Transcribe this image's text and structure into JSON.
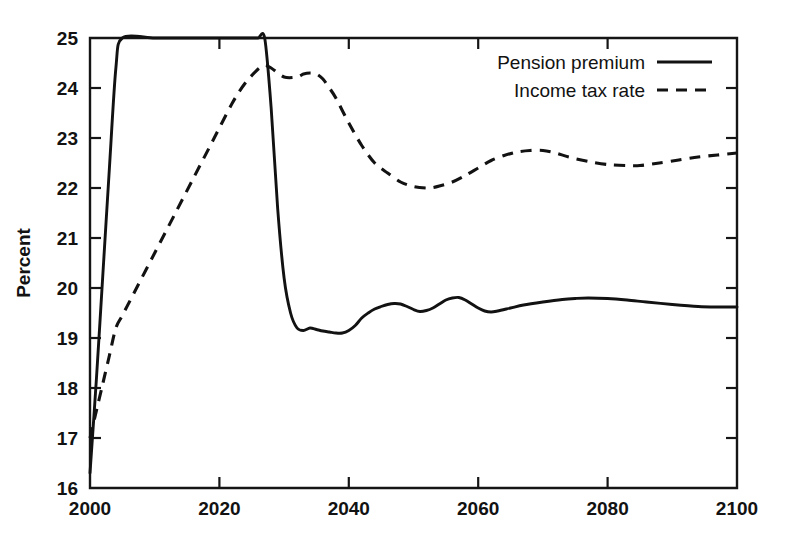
{
  "chart_data": {
    "type": "line",
    "title": "",
    "subtitle": "",
    "xlabel": "",
    "ylabel": "Percent",
    "xlim": [
      2000,
      2100
    ],
    "ylim": [
      16,
      25
    ],
    "xticks": [
      2000,
      2020,
      2040,
      2060,
      2080,
      2100
    ],
    "yticks": [
      16,
      17,
      18,
      19,
      20,
      21,
      22,
      23,
      24,
      25
    ],
    "xtick_labels": [
      "2000",
      "2020",
      "2040",
      "2060",
      "2080",
      "2100"
    ],
    "ytick_labels": [
      "16",
      "17",
      "18",
      "19",
      "20",
      "21",
      "22",
      "23",
      "24",
      "25"
    ],
    "grid": false,
    "legend_position": "top-right",
    "line_color": "#121212",
    "series": [
      {
        "name": "Pension premium",
        "style": "solid",
        "x": [
          2000,
          2001,
          2002,
          2003,
          2004,
          2005,
          2010,
          2015,
          2020,
          2025,
          2026,
          2027,
          2028,
          2029,
          2030,
          2031,
          2032,
          2033,
          2034,
          2035,
          2036,
          2037,
          2038,
          2039,
          2040,
          2041,
          2042,
          2043,
          2044,
          2045,
          2046,
          2047,
          2048,
          2049,
          2050,
          2051,
          2052,
          2053,
          2054,
          2055,
          2056,
          2057,
          2058,
          2059,
          2060,
          2061,
          2062,
          2063,
          2065,
          2067,
          2070,
          2073,
          2075,
          2077,
          2080,
          2083,
          2086,
          2090,
          2094,
          2097,
          2100
        ],
        "values": [
          16.3,
          18.2,
          20.3,
          22.4,
          24.4,
          25.0,
          25.0,
          25.0,
          25.0,
          25.0,
          25.0,
          25.0,
          23.6,
          21.6,
          20.2,
          19.5,
          19.2,
          19.15,
          19.2,
          19.17,
          19.14,
          19.12,
          19.1,
          19.1,
          19.15,
          19.25,
          19.4,
          19.5,
          19.58,
          19.63,
          19.67,
          19.69,
          19.68,
          19.63,
          19.57,
          19.53,
          19.55,
          19.6,
          19.68,
          19.76,
          19.8,
          19.81,
          19.76,
          19.68,
          19.6,
          19.54,
          19.52,
          19.54,
          19.6,
          19.66,
          19.72,
          19.77,
          19.79,
          19.8,
          19.79,
          19.76,
          19.72,
          19.67,
          19.63,
          19.62,
          19.62
        ]
      },
      {
        "name": "Income tax rate",
        "style": "dashed",
        "x": [
          2000,
          2001,
          2002,
          2003,
          2004,
          2005,
          2007,
          2010,
          2013,
          2016,
          2019,
          2022,
          2024,
          2026,
          2027,
          2028,
          2030,
          2032,
          2033,
          2034,
          2035,
          2036,
          2037,
          2038,
          2040,
          2042,
          2044,
          2046,
          2048,
          2050,
          2052,
          2053,
          2054,
          2056,
          2058,
          2060,
          2062,
          2064,
          2066,
          2068,
          2070,
          2072,
          2074,
          2077,
          2080,
          2083,
          2085,
          2088,
          2091,
          2094,
          2097,
          2100
        ],
        "values": [
          17.0,
          17.55,
          18.1,
          18.65,
          19.2,
          19.45,
          19.95,
          20.7,
          21.45,
          22.2,
          22.95,
          23.7,
          24.1,
          24.38,
          24.45,
          24.4,
          24.22,
          24.22,
          24.28,
          24.3,
          24.28,
          24.18,
          24.0,
          23.8,
          23.3,
          22.85,
          22.5,
          22.3,
          22.12,
          22.03,
          22.0,
          22.01,
          22.04,
          22.12,
          22.25,
          22.4,
          22.55,
          22.65,
          22.72,
          22.75,
          22.75,
          22.7,
          22.62,
          22.53,
          22.47,
          22.45,
          22.45,
          22.5,
          22.56,
          22.62,
          22.66,
          22.7
        ]
      }
    ],
    "legend": [
      {
        "label": "Pension premium",
        "style": "solid"
      },
      {
        "label": "Income tax rate",
        "style": "dashed"
      }
    ]
  },
  "plot_geometry": {
    "left": 90,
    "right": 737,
    "top": 38,
    "bottom": 488
  }
}
